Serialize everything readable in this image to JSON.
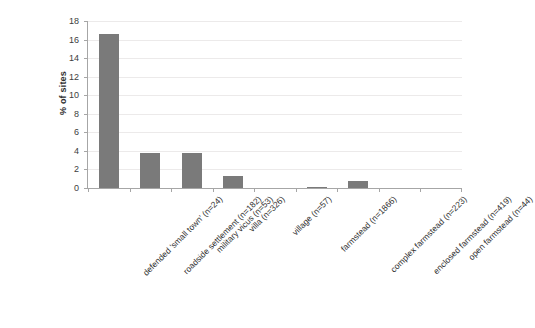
{
  "chart_data": {
    "type": "bar",
    "title": "",
    "xlabel": "",
    "ylabel": "% of sites",
    "ylim": [
      0,
      18
    ],
    "ytick_step": 2,
    "grid": true,
    "legend": false,
    "bar_color": "#7a7a7a",
    "gridline_color": "#eceaea",
    "axis_color": "#a6a6a6",
    "categories": [
      "defended 'small town' (n=24)",
      "roadside settlement (n=182)",
      "military vicus (n=53)",
      "villa (n=326)",
      "village (n=57)",
      "farmstead (n=1866)",
      "complex farmstead (n=223)",
      "enclosed farmstead (n=419)",
      "open farmstead (n=44)"
    ],
    "values": [
      16.65,
      3.8,
      3.75,
      1.25,
      0,
      0.1,
      0.8,
      0,
      0
    ],
    "yticks": [
      "0",
      "2",
      "4",
      "6",
      "8",
      "10",
      "12",
      "14",
      "16",
      "18"
    ]
  }
}
